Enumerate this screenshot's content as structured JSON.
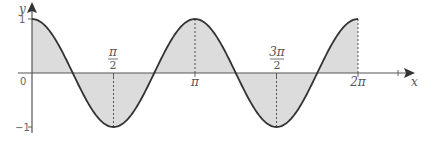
{
  "chart_data": {
    "type": "area",
    "title": "",
    "function": "y = cos(2x)",
    "xlabel": "x",
    "ylabel": "y",
    "xlim": [
      0,
      6.2832
    ],
    "ylim": [
      -1,
      1
    ],
    "x_ticks": [
      {
        "value": 0,
        "label": "0"
      },
      {
        "value": 1.5708,
        "label_num": "π",
        "label_den": "2"
      },
      {
        "value": 3.1416,
        "label": "π"
      },
      {
        "value": 4.7124,
        "label_num": "3π",
        "label_den": "2"
      },
      {
        "value": 6.2832,
        "label": "2π"
      }
    ],
    "y_ticks": [
      {
        "value": 1,
        "label": "1"
      },
      {
        "value": -1,
        "label": "−1"
      }
    ],
    "key_points": [
      {
        "x": 0,
        "y": 1
      },
      {
        "x": 0.7854,
        "y": 0
      },
      {
        "x": 1.5708,
        "y": -1
      },
      {
        "x": 2.3562,
        "y": 0
      },
      {
        "x": 3.1416,
        "y": 1
      },
      {
        "x": 3.927,
        "y": 0
      },
      {
        "x": 4.7124,
        "y": -1
      },
      {
        "x": 5.4978,
        "y": 0
      },
      {
        "x": 6.2832,
        "y": 1
      }
    ],
    "shaded_region": "area between curve and x-axis from 0 to 2π",
    "dashed_verticals_at": [
      1.5708,
      3.1416,
      4.7124,
      6.2832
    ],
    "grid": false,
    "legend": null
  },
  "labels": {
    "y_axis": "y",
    "x_axis": "x",
    "origin": "0",
    "y_one": "1",
    "y_neg_one": "−1",
    "pi_half_num": "π",
    "pi_half_den": "2",
    "pi": "π",
    "three_pi_half_num": "3π",
    "three_pi_half_den": "2",
    "two_pi": "2π"
  },
  "colors": {
    "curve": "#333333",
    "fill": "#dcdcdc",
    "axis": "#555555",
    "dashed": "#444444"
  }
}
